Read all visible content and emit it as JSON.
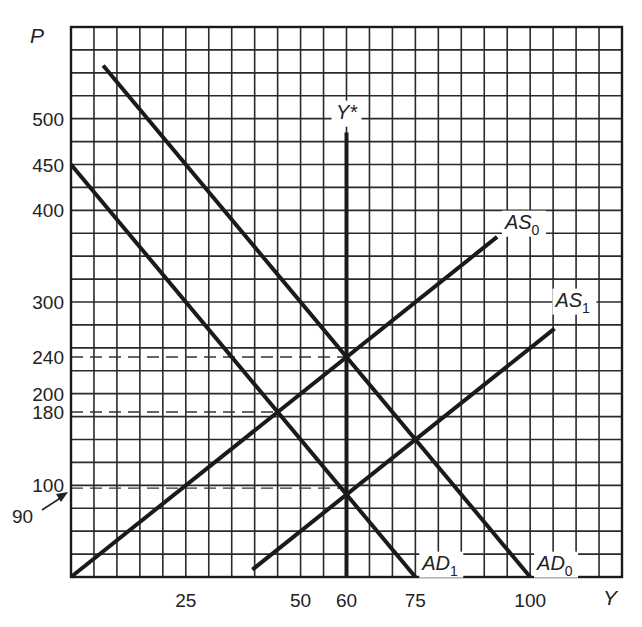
{
  "chart_data": {
    "type": "line",
    "title": "",
    "xlabel": "Y",
    "ylabel": "P",
    "xlim": [
      0,
      120
    ],
    "ylim": [
      0,
      600
    ],
    "grid": true,
    "grid_step_x": 5,
    "grid_step_y": 25,
    "x_ticks": [
      25,
      50,
      60,
      75,
      100
    ],
    "y_ticks": [
      500,
      450,
      400,
      300,
      240,
      200,
      180,
      100
    ],
    "y_annotation": {
      "label": "90",
      "value": 90,
      "arrow": true
    },
    "series": [
      {
        "name": "AD0",
        "label": "AD",
        "subscript": "0",
        "points": [
          [
            7,
            558
          ],
          [
            100,
            0
          ]
        ]
      },
      {
        "name": "AD1",
        "label": "AD",
        "subscript": "1",
        "points": [
          [
            0,
            450
          ],
          [
            75,
            0
          ]
        ]
      },
      {
        "name": "AS0",
        "label": "AS",
        "subscript": "0",
        "points": [
          [
            0,
            0
          ],
          [
            92.8,
            371
          ]
        ]
      },
      {
        "name": "AS1",
        "label": "AS",
        "subscript": "1",
        "points": [
          [
            39.5,
            8
          ],
          [
            105.3,
            271
          ]
        ]
      },
      {
        "name": "Y*",
        "label": "Y*",
        "subscript": "",
        "points": [
          [
            60,
            0
          ],
          [
            60,
            485
          ]
        ]
      }
    ],
    "reference_lines": [
      {
        "type": "horizontal",
        "value": 240,
        "from_x": 0,
        "to_x": 60,
        "style": "dashed"
      },
      {
        "type": "horizontal",
        "value": 180,
        "from_x": 0,
        "to_x": 45,
        "style": "dashed"
      },
      {
        "type": "horizontal",
        "value": 97,
        "from_x": 0,
        "to_x": 60,
        "style": "dashed"
      }
    ],
    "labels": {
      "AD0": {
        "x": 101.5,
        "y": 8
      },
      "AD1": {
        "x": 76.5,
        "y": 8
      },
      "AS0": {
        "x": 94.5,
        "y": 380
      },
      "AS1": {
        "x": 105.5,
        "y": 295
      },
      "Y*": {
        "x": 60,
        "y": 500
      }
    }
  }
}
